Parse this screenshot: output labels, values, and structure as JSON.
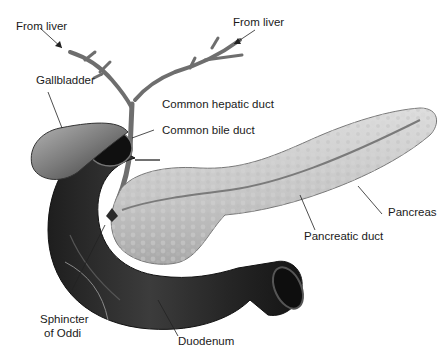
{
  "figure": {
    "labels": {
      "from_liver_left": "From liver",
      "from_liver_right": "From liver",
      "gallbladder": "Gallbladder",
      "common_hepatic_duct": "Common hepatic duct",
      "common_bile_duct": "Common bile duct",
      "pancreas": "Pancreas",
      "pancreatic_duct": "Pancreatic duct",
      "sphincter_line1": "Sphincter",
      "sphincter_line2": "of Oddi",
      "duodenum": "Duodenum"
    },
    "colors": {
      "background": "#ffffff",
      "duodenum": "#2a2a2a",
      "pancreas": "#c9c9c9",
      "gallbladder": "#7a7a7a",
      "ducts": "#6e6e6e",
      "text": "#1a1a1a"
    }
  }
}
